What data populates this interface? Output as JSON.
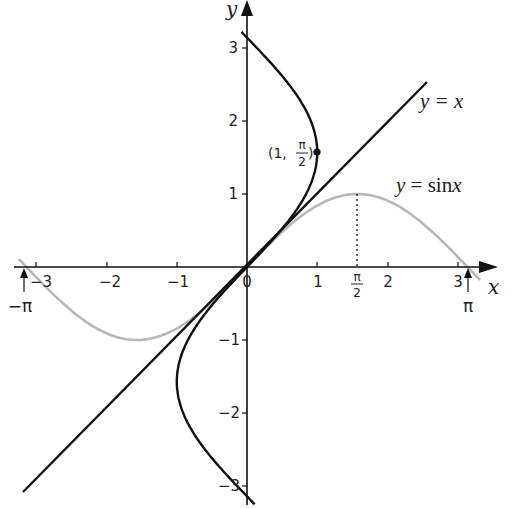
{
  "chart_data": {
    "type": "line",
    "title": "",
    "xlabel": "x",
    "ylabel": "y",
    "xlim": [
      -3.2,
      3.35
    ],
    "ylim": [
      -3.25,
      3.6
    ],
    "grid": false,
    "x_ticks": [
      "-3",
      "-2",
      "-1",
      "0",
      "1",
      "2",
      "3"
    ],
    "y_ticks": [
      "-3",
      "-2",
      "-1",
      "1",
      "2",
      "3"
    ],
    "special_x_ticks": [
      {
        "value": -3.14159,
        "label": "-π"
      },
      {
        "value": 1.5708,
        "label": "π/2"
      },
      {
        "value": 3.14159,
        "label": "π"
      }
    ],
    "series": [
      {
        "name": "y = x",
        "style": "solid",
        "color": "#111111",
        "x_range": [
          -3.2,
          2.6
        ]
      },
      {
        "name": "y = sin x",
        "style": "solid",
        "color": "#b3b3b3",
        "x_range": [
          -3.25,
          3.3
        ]
      },
      {
        "name": "x = sin y",
        "style": "solid",
        "color": "#111111",
        "y_range": [
          -3.2,
          3.2
        ]
      }
    ],
    "annotations": [
      {
        "text": "(1, π/2)",
        "x": 1,
        "y": 1.5708,
        "marker": "dot"
      },
      {
        "text": "dotted line from (π/2, 0) to (π/2, 1)"
      }
    ]
  },
  "labels": {
    "x_axis": "x",
    "y_axis": "y",
    "origin": "0",
    "x_ticks": [
      "−3",
      "−2",
      "−1",
      "1",
      "2",
      "3"
    ],
    "y_ticks_pos": [
      "1",
      "2",
      "3"
    ],
    "y_ticks_neg": [
      "−1",
      "−2",
      "−3"
    ],
    "neg_pi": "−π",
    "pi": "π",
    "half_pi_num": "π",
    "half_pi_den": "2",
    "line_label": "y = x",
    "sin_label_y": "y",
    "sin_label_eq": " = sin",
    "sin_label_x": "x",
    "point_prefix": "(1,",
    "point_num": "π",
    "point_den": "2",
    "point_suffix": ")"
  },
  "colors": {
    "axis": "#111111",
    "line": "#111111",
    "sine": "#b8b8b8",
    "inverse": "#111111"
  }
}
